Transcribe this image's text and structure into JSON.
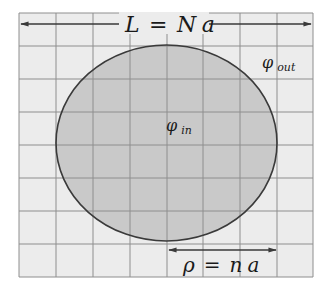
{
  "diagram": {
    "colors": {
      "background": "#ffffff",
      "grid_fill": "#ececec",
      "grid_line": "#8e8e8e",
      "disk_fill": "#c9c9c9",
      "disk_stroke": "#3a3a3a",
      "arrow": "#3a3a3a",
      "text": "#1a1a1a"
    },
    "grid": {
      "columns": 8,
      "rows": 8
    },
    "labels": {
      "box_size": {
        "lhs": "L",
        "eq": "=",
        "rhs_main": "N",
        "rhs_sub": "a"
      },
      "radius": {
        "lhs": "ρ",
        "eq": "=",
        "rhs_main": "n",
        "rhs_sub": "a"
      },
      "phi_in": {
        "symbol": "φ",
        "subscript": "in"
      },
      "phi_out": {
        "symbol": "φ",
        "subscript": "out"
      }
    }
  }
}
